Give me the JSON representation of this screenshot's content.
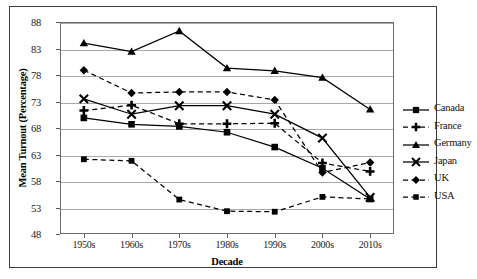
{
  "chart_data": {
    "type": "line",
    "title": "",
    "xlabel": "Decade",
    "ylabel": "Mean Turnout (Percentage)",
    "categories": [
      "1950s",
      "1960s",
      "1970s",
      "1980s",
      "1990s",
      "2000s",
      "2010s"
    ],
    "ylim": [
      48,
      88
    ],
    "yticks": [
      48,
      53,
      58,
      63,
      68,
      73,
      78,
      83,
      88
    ],
    "grid": true,
    "legend_position": "right",
    "series": [
      {
        "name": "Canada",
        "marker": "square",
        "line_style": "solid",
        "color": "#000000",
        "values": [
          69.9,
          68.7,
          68.3,
          67.2,
          64.4,
          60.4,
          54.6
        ]
      },
      {
        "name": "France",
        "marker": "plus",
        "line_style": "dashed",
        "color": "#000000",
        "values": [
          71.3,
          72.3,
          68.8,
          68.8,
          68.9,
          61.4,
          59.8
        ]
      },
      {
        "name": "Germany",
        "marker": "triangle",
        "line_style": "solid",
        "color": "#000000",
        "values": [
          84.0,
          82.4,
          86.3,
          79.3,
          78.8,
          77.5,
          71.5
        ]
      },
      {
        "name": "Japan",
        "marker": "x",
        "line_style": "solid",
        "color": "#000000",
        "values": [
          73.5,
          70.6,
          72.2,
          72.2,
          70.6,
          66.1,
          54.9
        ]
      },
      {
        "name": "UK",
        "marker": "diamond",
        "line_style": "dashed",
        "color": "#000000",
        "values": [
          78.9,
          74.6,
          74.8,
          74.8,
          73.3,
          59.6,
          61.5
        ]
      },
      {
        "name": "USA",
        "marker": "square-small",
        "line_style": "dashed",
        "color": "#000000",
        "values": [
          62.1,
          61.8,
          54.5,
          52.3,
          52.2,
          55.0,
          54.6
        ]
      }
    ]
  },
  "axis": {
    "y_title": "Mean Turnout (Percentage)",
    "x_title": "Decade"
  },
  "legend": {
    "items": [
      {
        "label": "Canada"
      },
      {
        "label": "France"
      },
      {
        "label": "Germany"
      },
      {
        "label": "Japan"
      },
      {
        "label": "UK"
      },
      {
        "label": "USA"
      }
    ]
  },
  "caption": {
    "text": ""
  }
}
